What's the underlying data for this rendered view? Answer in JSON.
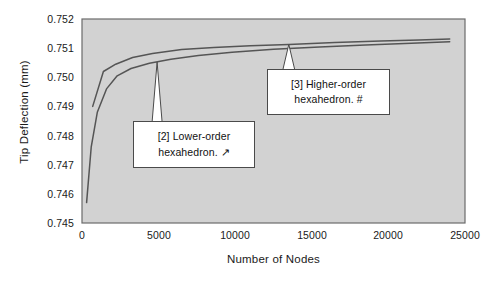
{
  "chart_data": {
    "type": "line",
    "title": "",
    "xlabel": "Number of Nodes",
    "ylabel": "Tip Deflection (mm)",
    "xlim": [
      0,
      25000
    ],
    "ylim": [
      0.745,
      0.752
    ],
    "xticks": [
      "0",
      "5000",
      "10000",
      "15000",
      "20000",
      "25000"
    ],
    "xtick_values": [
      0,
      5000,
      10000,
      15000,
      20000,
      25000
    ],
    "yticks": [
      "0.745",
      "0.746",
      "0.747",
      "0.748",
      "0.749",
      "0.750",
      "0.751",
      "0.752"
    ],
    "ytick_values": [
      0.745,
      0.746,
      0.747,
      0.748,
      0.749,
      0.75,
      0.751,
      0.752
    ],
    "grid": false,
    "legend_position": "annotations",
    "plot_background": "#d2d2d2",
    "line_color": "#555555",
    "series": [
      {
        "name": "[3] Higher-order hexahedron",
        "marker": "#",
        "x": [
          700,
          1400,
          2200,
          3300,
          4600,
          6500,
          8600,
          11000,
          13500,
          16500,
          19500,
          22000,
          24000
        ],
        "y": [
          0.749,
          0.7502,
          0.75045,
          0.75068,
          0.75082,
          0.75095,
          0.75102,
          0.75108,
          0.75113,
          0.75119,
          0.75124,
          0.75128,
          0.75131
        ]
      },
      {
        "name": "[2] Lower-order hexahedron",
        "marker": "arrow",
        "x": [
          300,
          600,
          1000,
          1600,
          2300,
          3200,
          4400,
          5800,
          7600,
          9800,
          12500,
          15500,
          18500,
          21500,
          24000
        ],
        "y": [
          0.7457,
          0.7476,
          0.7488,
          0.7496,
          0.75005,
          0.7503,
          0.75048,
          0.75062,
          0.75075,
          0.75086,
          0.75096,
          0.75104,
          0.75111,
          0.75117,
          0.75122
        ]
      }
    ],
    "annotations": [
      {
        "id": "lower-order",
        "line1": "[2] Lower-order",
        "line2": "hexahedron.  ↗",
        "pointer_x": 4900,
        "pointer_y": 0.75052
      },
      {
        "id": "higher-order",
        "line1": "[3] Higher-order",
        "line2": "hexahedron.  #",
        "pointer_x": 13500,
        "pointer_y": 0.75113
      }
    ]
  }
}
